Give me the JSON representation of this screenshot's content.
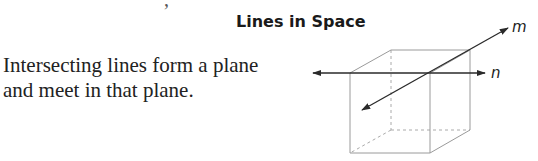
{
  "section": {
    "cut_off_glyph": ",",
    "title": "Lines in Space",
    "description": {
      "line1": "Intersecting lines form a plane",
      "line2": "and meet in that plane."
    }
  },
  "figure": {
    "type": "cube-with-intersecting-lines",
    "lines": [
      {
        "label": "m",
        "description": "oblique line through cube, arrow at both ends"
      },
      {
        "label": "n",
        "description": "horizontal line along front-top edge of cube, arrow at both ends"
      }
    ],
    "intersection": "front-top-right corner of cube",
    "colors": {
      "cube_edges": "#9a9a9a",
      "hidden_edges": "#aaaaaa",
      "lines": "#2a2a2a"
    }
  }
}
